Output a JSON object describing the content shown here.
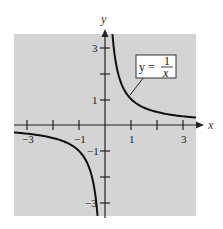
{
  "chart_data": {
    "type": "line",
    "title": "",
    "xlabel": "x",
    "ylabel": "y",
    "xlim": [
      -3.5,
      3.5
    ],
    "ylim": [
      -3.5,
      3.5
    ],
    "grid": false,
    "x_ticks": [
      -3,
      -2,
      -1,
      1,
      2,
      3
    ],
    "y_ticks": [
      -3,
      -2,
      -1,
      1,
      2,
      3
    ],
    "x_tick_labels": [
      {
        "value": -3,
        "label": "−3"
      },
      {
        "value": -1,
        "label": "−1"
      },
      {
        "value": 1,
        "label": "1"
      },
      {
        "value": 3,
        "label": "3"
      }
    ],
    "y_tick_labels": [
      {
        "value": 3,
        "label": "3"
      },
      {
        "value": 1,
        "label": "1"
      },
      {
        "value": -1,
        "label": "−1"
      },
      {
        "value": -3,
        "label": "−3"
      }
    ],
    "series": [
      {
        "name": "y = 1/x",
        "function": "1/x",
        "branches": [
          {
            "x": [
              0.286,
              0.333,
              0.4,
              0.5,
              0.667,
              1,
              1.5,
              2,
              2.5,
              3,
              3.5
            ],
            "y": [
              3.5,
              3,
              2.5,
              2,
              1.5,
              1,
              0.667,
              0.5,
              0.4,
              0.333,
              0.286
            ]
          },
          {
            "x": [
              -3.5,
              -3,
              -2.5,
              -2,
              -1.5,
              -1,
              -0.667,
              -0.5,
              -0.4,
              -0.333,
              -0.286
            ],
            "y": [
              -0.286,
              -0.333,
              -0.4,
              -0.5,
              -0.667,
              -1,
              -1.5,
              -2,
              -2.5,
              -3,
              -3.5
            ]
          }
        ]
      }
    ],
    "annotation": {
      "lhs": "y = ",
      "numerator": "1",
      "denominator": "x"
    },
    "colors": {
      "plot_bg": "#d4d4d4",
      "curve": "#111111",
      "axis": "#222222",
      "label_box_bg": "#ffffff"
    }
  }
}
